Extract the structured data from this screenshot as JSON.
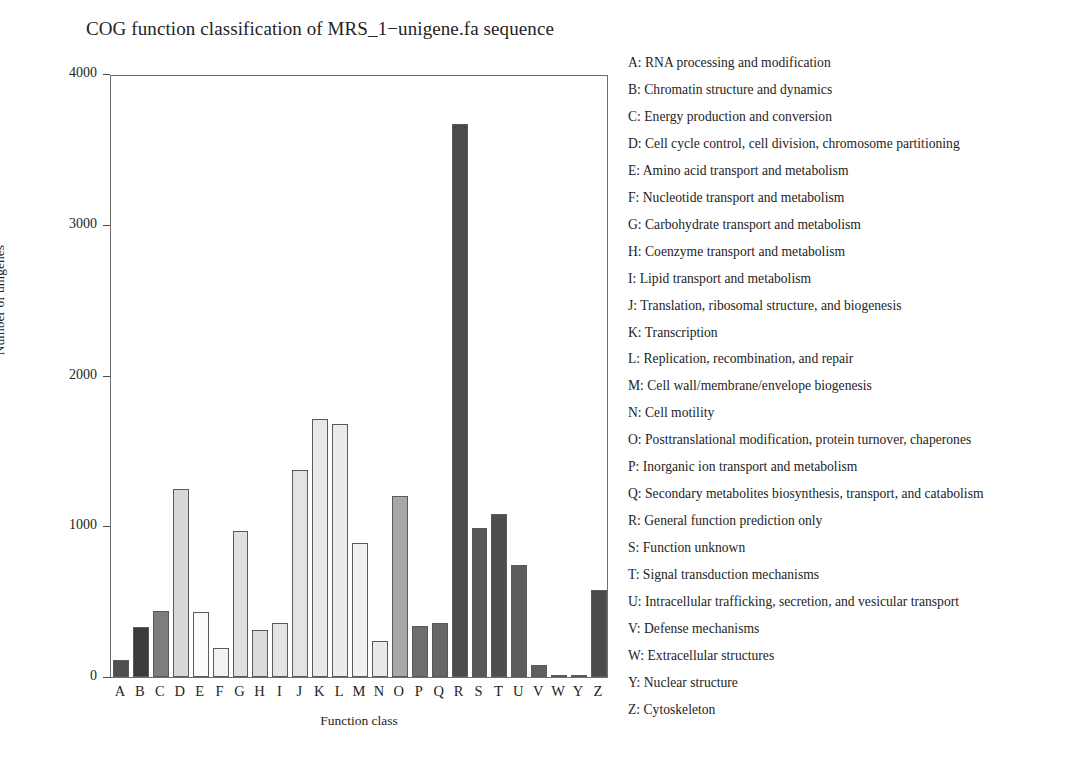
{
  "chart_data": {
    "type": "bar",
    "title": "COG function classification of MRS_1−unigene.fa sequence",
    "xlabel": "Function class",
    "ylabel": "Number of unigenes",
    "ylim": [
      0,
      4000
    ],
    "yticks": [
      0,
      1000,
      2000,
      3000,
      4000
    ],
    "ytick_labels": [
      "0",
      "1000",
      "2000",
      "3000",
      "4000"
    ],
    "grid": false,
    "legend_position": "right",
    "categories": [
      "A",
      "B",
      "C",
      "D",
      "E",
      "F",
      "G",
      "H",
      "I",
      "J",
      "K",
      "L",
      "M",
      "N",
      "O",
      "P",
      "Q",
      "R",
      "S",
      "T",
      "U",
      "V",
      "W",
      "Y",
      "Z"
    ],
    "values": [
      110,
      330,
      440,
      1250,
      430,
      195,
      970,
      315,
      360,
      1370,
      1710,
      1680,
      890,
      240,
      1200,
      340,
      360,
      3670,
      990,
      1080,
      745,
      78,
      16,
      10,
      575
    ],
    "bar_colors": [
      "#4f4f4f",
      "#3b3b3b",
      "#7d7d7d",
      "#d8d8d8",
      "#fbfbfb",
      "#f2f2f2",
      "#e0e0e0",
      "#dcdcdc",
      "#e3e3e3",
      "#e3e3e3",
      "#e8e8e8",
      "#ebebeb",
      "#f0f0f0",
      "#e8e8e8",
      "#a8a8a8",
      "#6e6e6e",
      "#676767",
      "#4a4a4a",
      "#585858",
      "#4e4e4e",
      "#5c5c5c",
      "#5f5f5f",
      "#6b6b6b",
      "#6b6b6b",
      "#4a4a4a"
    ],
    "legend_entries": [
      "A: RNA processing and modification",
      "B: Chromatin structure and dynamics",
      "C: Energy production and conversion",
      "D: Cell cycle control, cell division, chromosome partitioning",
      "E: Amino acid transport and metabolism",
      "F: Nucleotide transport and metabolism",
      "G: Carbohydrate transport and metabolism",
      "H: Coenzyme transport and metabolism",
      "I: Lipid transport and metabolism",
      "J: Translation, ribosomal structure, and biogenesis",
      "K: Transcription",
      "L: Replication, recombination, and repair",
      "M: Cell wall/membrane/envelope biogenesis",
      "N: Cell motility",
      "O: Posttranslational modification, protein turnover, chaperones",
      "P: Inorganic ion transport and metabolism",
      "Q: Secondary metabolites biosynthesis, transport, and catabolism",
      "R: General function prediction only",
      "S: Function unknown",
      "T: Signal transduction mechanisms",
      "U: Intracellular trafficking, secretion, and vesicular transport",
      "V: Defense mechanisms",
      "W: Extracellular structures",
      "Y: Nuclear structure",
      "Z: Cytoskeleton"
    ]
  }
}
